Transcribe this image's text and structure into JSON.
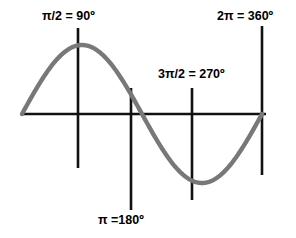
{
  "chart_data": {
    "type": "line",
    "title": "",
    "subtitle": "",
    "xlabel": "",
    "ylabel": "",
    "function": "sin(x)",
    "xlim": [
      0,
      6.283185307179586
    ],
    "ylim": [
      -1,
      1
    ],
    "grid": false,
    "legend": null,
    "axes": {
      "x_axis_visible": true,
      "y_axis_visible": false,
      "x_axis_y_value": 0
    },
    "series": [
      {
        "name": "sine",
        "color": "#787878",
        "line_width": 4,
        "x": [
          0,
          0.3927,
          0.7854,
          1.1781,
          1.5708,
          1.9635,
          2.3562,
          2.7489,
          3.1416,
          3.5343,
          3.927,
          4.3197,
          4.7124,
          5.1051,
          5.4978,
          5.8905,
          6.2832
        ],
        "y": [
          0,
          0.3827,
          0.7071,
          0.9239,
          1,
          0.9239,
          0.7071,
          0.3827,
          0,
          -0.3827,
          -0.7071,
          -0.9239,
          -1,
          -0.9239,
          -0.7071,
          -0.3827,
          0
        ]
      }
    ],
    "annotations": [
      {
        "name": "pi-over-2",
        "label": "π/2 = 90º",
        "x_value": 1.5708,
        "degrees": 90,
        "tick_color": "#111111"
      },
      {
        "name": "pi",
        "label": "π =180º",
        "x_value": 3.1416,
        "degrees": 180,
        "tick_color": "#111111"
      },
      {
        "name": "three-pi-over-2",
        "label": "3π/2 = 270º",
        "x_value": 4.7124,
        "degrees": 270,
        "tick_color": "#111111"
      },
      {
        "name": "two-pi",
        "label": "2π = 360º",
        "x_value": 6.2832,
        "degrees": 360,
        "tick_color": "#111111"
      }
    ],
    "colors": {
      "curve": "#787878",
      "axis": "#111111",
      "tick": "#111111",
      "text": "#000000",
      "background": "#ffffff"
    }
  },
  "labels": {
    "pi_over_2": "π/2 = 90º",
    "pi": "π =180º",
    "three_pi_over_2": "3π/2 = 270º",
    "two_pi": "2π = 360º"
  }
}
